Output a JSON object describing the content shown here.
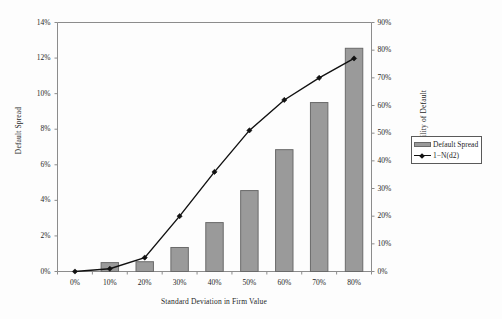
{
  "chart_data": {
    "type": "bar",
    "title": "",
    "xlabel": "Standard Deviation in Firm Value",
    "categories": [
      "0%",
      "10%",
      "20%",
      "30%",
      "40%",
      "50%",
      "60%",
      "70%",
      "80%"
    ],
    "grid": false,
    "legend_position": "right",
    "axes": {
      "left": {
        "label": "Default Spread",
        "ticks": [
          "0%",
          "2%",
          "4%",
          "6%",
          "8%",
          "10%",
          "12%",
          "14%"
        ],
        "tick_values": [
          0,
          2,
          4,
          6,
          8,
          10,
          12,
          14
        ],
        "ylim": [
          0,
          14
        ]
      },
      "right": {
        "label": "Probability of Default",
        "ticks": [
          "0%",
          "10%",
          "20%",
          "30%",
          "40%",
          "50%",
          "60%",
          "70%",
          "80%",
          "90%"
        ],
        "tick_values": [
          0,
          10,
          20,
          30,
          40,
          50,
          60,
          70,
          80,
          90
        ],
        "ylim": [
          0,
          90
        ]
      }
    },
    "series": [
      {
        "name": "Default Spread",
        "type": "bar",
        "axis": "left",
        "color": "#9a9a9a",
        "edge_color": "#6a6a6a",
        "values": [
          0,
          0.5,
          0.55,
          1.35,
          2.75,
          4.55,
          6.85,
          9.5,
          12.55
        ]
      },
      {
        "name": "1−N(d2)",
        "type": "line",
        "axis": "right",
        "color": "#111111",
        "marker": "diamond",
        "values": [
          0,
          1,
          5,
          20,
          36,
          51,
          62,
          70,
          77
        ]
      }
    ]
  },
  "legend": {
    "items": [
      {
        "label": "Default Spread",
        "marker": "bar-swatch"
      },
      {
        "label": "1−N(d2)",
        "marker": "line-diamond"
      }
    ]
  },
  "axis_titles": {
    "left": "Default Spread",
    "right": "Probability of Default",
    "bottom": "Standard Deviation in Firm Value"
  },
  "colors": {
    "bar_fill": "#9a9a9a",
    "bar_edge": "#6a6a6a",
    "line": "#111111",
    "frame": "#8c8c8c",
    "text": "#1f1f1f",
    "background": "#fdfdfd"
  }
}
